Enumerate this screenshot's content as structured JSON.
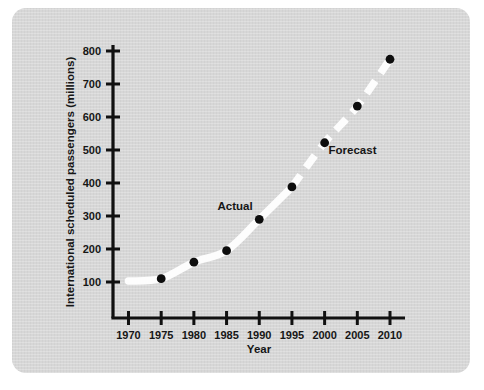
{
  "figure": {
    "panel_background_color": "#d7d7d7",
    "page_background_color": "#ffffff",
    "line_color": "#fdfdfd",
    "marker_color": "#0d0d0d",
    "axis_color": "#111111"
  },
  "chart_data": {
    "type": "line",
    "title": "",
    "xlabel": "Year",
    "ylabel": "International scheduled passengers (millions)",
    "x": [
      1970,
      1975,
      1980,
      1985,
      1990,
      1995,
      2000,
      2005,
      2010
    ],
    "xticklabels": [
      "1970",
      "1975",
      "1980",
      "1985",
      "1990",
      "1995",
      "2000",
      "2005",
      "2010"
    ],
    "yticks": [
      100,
      200,
      300,
      400,
      500,
      600,
      700,
      800
    ],
    "yticklabels": [
      "100",
      "200",
      "300",
      "400",
      "500",
      "600",
      "700",
      "800"
    ],
    "xlim": [
      1968,
      2012
    ],
    "ylim": [
      0,
      840
    ],
    "grid": false,
    "legend": "none",
    "series": [
      {
        "name": "Actual",
        "style": "solid",
        "x": [
          1970,
          1975,
          1980,
          1985,
          1990,
          1995
        ],
        "values": [
          103,
          110,
          160,
          195,
          290,
          388
        ]
      },
      {
        "name": "Forecast",
        "style": "dashed",
        "x": [
          1995,
          2000,
          2005,
          2010
        ],
        "values": [
          388,
          522,
          633,
          775
        ]
      }
    ],
    "markers": [
      {
        "x": 1975,
        "y": 110
      },
      {
        "x": 1980,
        "y": 160
      },
      {
        "x": 1985,
        "y": 195
      },
      {
        "x": 1990,
        "y": 290
      },
      {
        "x": 1995,
        "y": 388
      },
      {
        "x": 2000,
        "y": 522
      },
      {
        "x": 2005,
        "y": 633
      },
      {
        "x": 2010,
        "y": 775
      }
    ],
    "annotations": [
      {
        "text": "Actual",
        "x": 1989,
        "y": 318
      },
      {
        "text": "Forecast",
        "x": 2000.6,
        "y": 487
      }
    ]
  }
}
